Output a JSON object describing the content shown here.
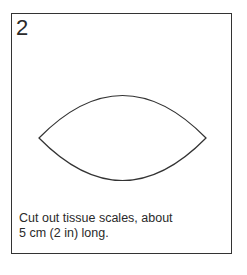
{
  "step": {
    "number": "2",
    "caption_line1": "Cut out tissue scales, about",
    "caption_line2": "5 cm (2 in) long."
  },
  "illustration": {
    "shape": "lens-shaped tissue scale outline",
    "stroke_color": "#333333"
  }
}
